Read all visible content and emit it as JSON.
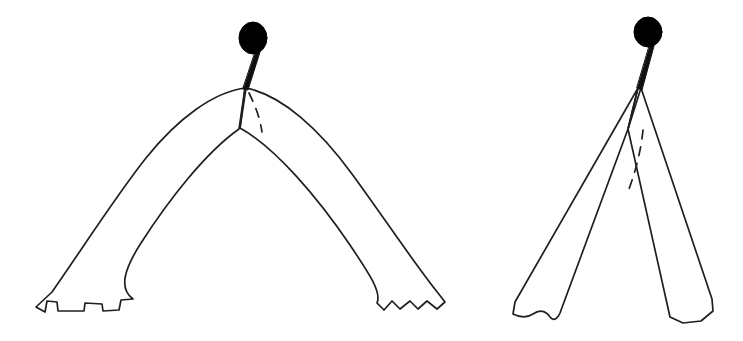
{
  "page": {
    "kind": "scanned-line-drawing",
    "background_color": "#ffffff",
    "ink_color": "#1a1a1a",
    "fill_color": "#000000",
    "width": 743,
    "height": 341
  },
  "figure": {
    "title": "Two line drawings of a forked bifurcated implement",
    "panel_count": 2,
    "panels": [
      {
        "id": "panel-left",
        "label": "",
        "view": "spread open / lateral view",
        "description": "Wide arched fork: a black spherical head on a short thick stem descends to an apex from which two broad tapering bands curve outward and downward in a shallow arch; both distal ends terminate in irregular serrated notches.",
        "head": {
          "shape": "ellipse",
          "cx": 253,
          "cy": 38,
          "rx": 14,
          "ry": 16,
          "fill": "#000000"
        },
        "stem": {
          "from": [
            251,
            53
          ],
          "to": [
            245,
            88
          ],
          "width_top": 5,
          "width_bottom": 3
        },
        "apex": [
          245,
          88
        ],
        "inner_vertex": [
          240,
          127
        ],
        "dashed_lines": 1,
        "distal_ends": [
          "serrated",
          "serrated"
        ],
        "arm_count": 2
      },
      {
        "id": "panel-right",
        "label": "",
        "view": "closed / frontal view",
        "description": "Narrow crossed fork: the same black spherical head on a stem meets an apex from which two narrow straight bands splay downward, crossing each other just below the apex; left end has a wavy scalloped edge, right end is bevelled.",
        "head": {
          "shape": "ellipse",
          "cx": 648,
          "cy": 32,
          "rx": 14,
          "ry": 15,
          "fill": "#000000"
        },
        "stem": {
          "from": [
            646,
            47
          ],
          "to": [
            638,
            87
          ],
          "width_top": 5,
          "width_bottom": 3
        },
        "apex": [
          638,
          87
        ],
        "inner_vertex": [
          628,
          128
        ],
        "dashed_lines": 1,
        "distal_ends": [
          "wavy",
          "bevelled"
        ],
        "arm_count": 2
      }
    ]
  },
  "caption_remnant": {
    "visible": true,
    "note": "bottom edges of a cropped text line clipped at the top margin",
    "marks": 3
  },
  "geometry": {
    "left_panel": {
      "outer_upper_left": "M245,88 C200,96 150,140 108,200 C84,236 58,278 36,306",
      "outer_left_tip": "M36,306 L45,311 L48,300 L56,301 L57,310 L83,310 L84,303 L101,303 L102,310 L118,309 L120,300 L132,299",
      "inner_left_edge": "M240,127 C208,136 172,168 140,214 C118,248 96,280 132,299",
      "outer_upper_right": "M245,88 C290,99 336,150 374,206 C396,240 420,272 443,296",
      "outer_right_tip": "M443,296 L436,306 L426,300 L418,307 L410,300 L400,308 L392,301 L384,309 L378,302",
      "inner_right_edge": "M240,127 C274,140 310,178 342,226 C364,260 382,286 378,302",
      "dashed": "M247,92 C252,104 258,118 260,131",
      "spine": "M245,88 L240,127"
    },
    "right_panel": {
      "left_band_outer": "M638,87 L516,303",
      "left_band_inner": "M628,128 L558,314",
      "left_tip": "M516,303 L514,315 L527,318 L540,314 L548,320 L558,314",
      "right_band_outer": "M640,87 L713,300",
      "right_band_inner": "M628,128 L670,318",
      "right_tip": "M713,300 L712,310 L700,320 L682,322 L670,318",
      "dashed": "M640,128 C638,148 634,168 628,186",
      "spine": "M638,87 L628,128"
    }
  }
}
